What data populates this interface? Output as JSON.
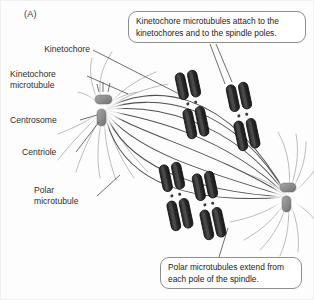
{
  "figure": {
    "panel_letter": "(A)"
  },
  "labels": [
    {
      "id": "kinetochore",
      "text": "Kinetochore"
    },
    {
      "id": "kinetochore-microtubule",
      "line1": "Kinetochore",
      "line2": "microtubule"
    },
    {
      "id": "centrosome",
      "text": "Centrosome"
    },
    {
      "id": "centriole",
      "text": "Centriole"
    },
    {
      "id": "polar-microtubule",
      "line1": "Polar",
      "line2": "microtubule"
    }
  ],
  "callouts": {
    "top": {
      "line1": "Kinetochore microtubules attach to the",
      "line2": "kinetochores and to the spindle poles."
    },
    "bottom": {
      "line1": "Polar microtubules extend from",
      "line2": "each pole of the spindle."
    }
  },
  "colors": {
    "background": "#fdfdfd",
    "chromosome_dark": "#2a2a2a",
    "chromosome_mid": "#4a4a4a",
    "centriole": "#8d8d8d",
    "kinetochore_fiber": "#555555",
    "polar_fiber": "#b0b0b0",
    "leader_line": "#4a4a4a",
    "callout_border": "#8e8e8e",
    "text": "#2e2e2e"
  },
  "structures": {
    "centrosomes": [
      {
        "id": "left-pole",
        "x": 104,
        "y": 110
      },
      {
        "id": "right-pole",
        "x": 288,
        "y": 197
      }
    ],
    "chromosomes": [
      {
        "id": "chromosome-1",
        "x": 192,
        "y": 104,
        "rotation": -12
      },
      {
        "id": "chromosome-2",
        "x": 243,
        "y": 116,
        "rotation": -12
      },
      {
        "id": "chromosome-3",
        "x": 176,
        "y": 196,
        "rotation": -12
      },
      {
        "id": "chromosome-4",
        "x": 209,
        "y": 205,
        "rotation": -12
      }
    ],
    "kinetochore_microtubule_count": 8,
    "polar_microtubule_count": 20
  }
}
